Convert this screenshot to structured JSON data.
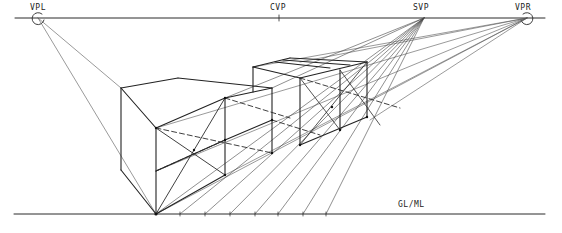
{
  "labels": {
    "vpl": "VPL",
    "cvp": "CVP",
    "svp": "SVP",
    "vpr": "VPR",
    "ground_line": "GL/ML"
  },
  "colors": {
    "ink": "#2a2a2a",
    "construction": "#555555",
    "background": "#ffffff"
  },
  "points": {
    "horizon_y": 18,
    "ground_y": 214,
    "vpl": [
      38,
      18
    ],
    "cvp": [
      279,
      18
    ],
    "svp": [
      424,
      18
    ],
    "vpr": [
      527,
      18
    ],
    "front_corner_base": [
      156,
      214
    ]
  }
}
